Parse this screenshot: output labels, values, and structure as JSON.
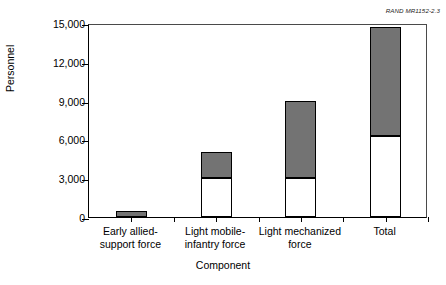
{
  "figure": {
    "source_tag": "RAND MR1152-2.3"
  },
  "chart_data": {
    "type": "bar",
    "stacked": true,
    "title": "",
    "xlabel": "Component",
    "ylabel": "Personnel",
    "ylim": [
      0,
      15000
    ],
    "yticks": [
      0,
      3000,
      6000,
      9000,
      12000,
      15000
    ],
    "ytick_labels": [
      "0",
      "3,000",
      "6,000",
      "9,000",
      "12,000",
      "15,000"
    ],
    "grid": false,
    "legend": "none",
    "categories": [
      "Early allied-support force",
      "Light mobile-infantry force",
      "Light mechanized force",
      "Total"
    ],
    "category_lines": [
      [
        "Early allied-",
        "support force"
      ],
      [
        "Light mobile-",
        "infantry force"
      ],
      [
        "Light mechanized",
        "force"
      ],
      [
        "Total",
        ""
      ]
    ],
    "series": [
      {
        "name": "lower-segment",
        "fill": "#ffffff",
        "values": [
          0,
          3000,
          3000,
          6300
        ]
      },
      {
        "name": "upper-segment",
        "fill": "#737373",
        "values": [
          500,
          2000,
          6000,
          8400
        ]
      }
    ],
    "totals": [
      500,
      5000,
      9000,
      14700
    ]
  },
  "colors": {
    "upper_fill": "#737373",
    "lower_fill": "#ffffff",
    "outline": "#000000",
    "background": "#ffffff"
  }
}
